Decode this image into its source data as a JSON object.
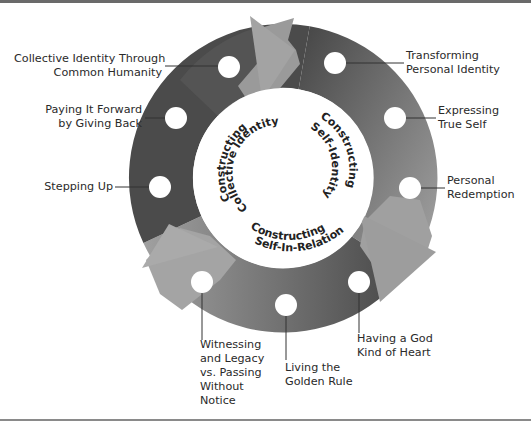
{
  "diagram": {
    "type": "cycle",
    "colors": {
      "ring_dark": "#4a4a4a",
      "ring_light": "#a8a8a8",
      "arrow": "#9c9c9c",
      "node": "#ffffff",
      "background": "#ffffff"
    },
    "center_labels": [
      {
        "id": "collective",
        "line1": "Constructing",
        "line2": "Collective Identity"
      },
      {
        "id": "self",
        "line1": "Constructing",
        "line2": "Self-Identity"
      },
      {
        "id": "relation",
        "line1": "Constructing",
        "line2": "Self-In-Relation"
      }
    ],
    "nodes": [
      {
        "id": "collective-identity-through-common-humanity",
        "lines": [
          "Collective Identity Through",
          "Common Humanity"
        ]
      },
      {
        "id": "paying-it-forward",
        "lines": [
          "Paying It Forward",
          "by Giving Back"
        ]
      },
      {
        "id": "stepping-up",
        "lines": [
          "Stepping Up"
        ]
      },
      {
        "id": "transforming-personal-identity",
        "lines": [
          "Transforming",
          "Personal Identity"
        ]
      },
      {
        "id": "expressing-true-self",
        "lines": [
          "Expressing",
          "True Self"
        ]
      },
      {
        "id": "personal-redemption",
        "lines": [
          "Personal",
          "Redemption"
        ]
      },
      {
        "id": "having-a-god-kind-of-heart",
        "lines": [
          "Having a God",
          "Kind of Heart"
        ]
      },
      {
        "id": "living-the-golden-rule",
        "lines": [
          "Living the",
          "Golden Rule"
        ]
      },
      {
        "id": "witnessing-and-legacy",
        "lines": [
          "Witnessing",
          "and Legacy",
          "vs. Passing",
          "Without",
          "Notice"
        ]
      }
    ]
  }
}
